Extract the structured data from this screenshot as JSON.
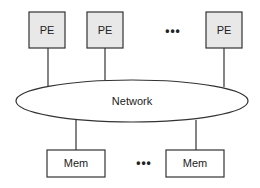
{
  "diagram": {
    "type": "shared-memory-multiprocessor",
    "processors": [
      {
        "label": "PE"
      },
      {
        "label": "PE"
      },
      {
        "label": "PE"
      }
    ],
    "processor_ellipsis": "•••",
    "network": {
      "label": "Network"
    },
    "memories": [
      {
        "label": "Mem"
      },
      {
        "label": "Mem"
      }
    ],
    "memory_ellipsis": "•••",
    "colors": {
      "pe_fill": "#e8e8e8",
      "mem_fill": "#ffffff",
      "stroke": "#333333",
      "background": "#ffffff"
    }
  }
}
